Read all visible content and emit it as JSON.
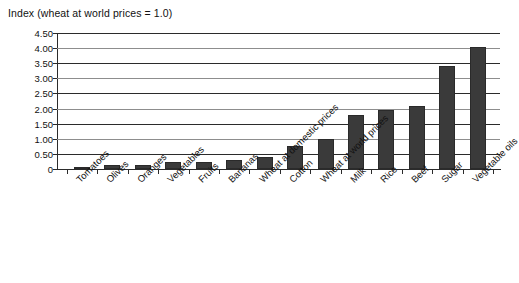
{
  "chart_data": {
    "type": "bar",
    "title": "Index (wheat at world prices = 1.0)",
    "xlabel": "",
    "ylabel": "Index (wheat at world prices = 1.0)",
    "ylim": [
      0,
      4.5
    ],
    "grid": true,
    "legend": false,
    "categories": [
      "Tomatoes",
      "Olives",
      "Oranges",
      "Vegetables",
      "Fruits",
      "Bananas",
      "Wheat at domestic prices",
      "Cotton",
      "Wheat at world prices",
      "Milk",
      "Rice",
      "Beef",
      "Sugar",
      "Vegetable oils"
    ],
    "values": [
      0.08,
      0.12,
      0.14,
      0.22,
      0.24,
      0.3,
      0.4,
      0.75,
      1.0,
      1.8,
      1.95,
      2.1,
      3.4,
      4.05
    ],
    "ytick_labels": [
      "4.50",
      "4.00",
      "3.50",
      "3.00",
      "2.50",
      "2.00",
      "1.50",
      "1.00",
      "0.50",
      "0"
    ],
    "ytick_values": [
      4.5,
      4.0,
      3.5,
      3.0,
      2.5,
      2.0,
      1.5,
      1.0,
      0.5,
      0
    ],
    "bar_color": "#3a3a3a",
    "grid_color": "#2b2b2b",
    "axis_color": "#2b2b2b",
    "text_color": "#111111"
  }
}
